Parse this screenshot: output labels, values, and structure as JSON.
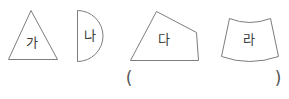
{
  "figure": {
    "background_color": "#ffffff",
    "stroke_color": "#7d7d7d",
    "label_color": "#3a3a3a",
    "shapes": [
      {
        "id": "shape-triangle",
        "name": "triangle",
        "label": "가",
        "label_x": 32,
        "label_y": 43,
        "geometry": "M 8.5 59.5 L 31 10.5 L 57.5 59.5 Z"
      },
      {
        "id": "shape-semicircle",
        "name": "semicircle",
        "label": "나",
        "label_x": 90,
        "label_y": 36,
        "geometry": "M 77.5 10.5 L 77.5 61.5 A 25.5 25.5 0 0 0 77.5 10.5 Z"
      },
      {
        "id": "shape-quadrilateral",
        "name": "quadrilateral",
        "label": "다",
        "label_x": 164,
        "label_y": 40,
        "geometry": "M 156.5 11.5 L 196.5 32.5 L 198.5 60.5 L 130.5 60.5 Z"
      },
      {
        "id": "shape-curved-trapezoid",
        "name": "curved-trapezoid",
        "label": "라",
        "label_x": 249,
        "label_y": 40,
        "geometry": "M 229.5 18.5 Q 249.5 26.5 270.5 18.5 L 278.5 56.5 Q 249.5 66.5 221.5 56.5 Z"
      }
    ],
    "answer_slot": {
      "open_paren": "(",
      "open_paren_x": 129,
      "open_paren_y": 79,
      "close_paren": ")",
      "close_paren_x": 278,
      "close_paren_y": 79
    }
  }
}
